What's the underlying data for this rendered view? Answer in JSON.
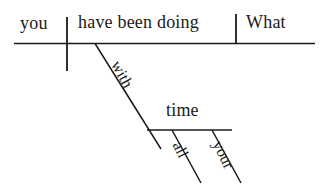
{
  "diagram": {
    "type": "reed-kellogg-sentence-diagram",
    "sentence": "What have you been doing with all your time",
    "ink_color": "#1c1a18",
    "background_color": "#ffffff",
    "baseline": {
      "subject": "you",
      "verb": "have been doing",
      "direct_object": "What"
    },
    "prepositional_phrase": {
      "preposition": "with",
      "object_of_preposition": "time",
      "modifiers": [
        "all",
        "your"
      ]
    },
    "labels": {
      "subject": "you",
      "verb": "have been doing",
      "object": "What",
      "preposition": "with",
      "prep_object": "time",
      "modifier_all": "all",
      "modifier_your": "your"
    }
  }
}
